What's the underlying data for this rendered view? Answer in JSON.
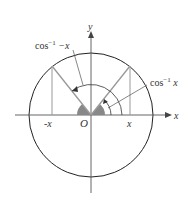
{
  "diagram": {
    "axes": {
      "x_label": "x",
      "y_label": "y",
      "origin_label": "O"
    },
    "tick_labels": {
      "neg_x": "-x",
      "pos_x": "x"
    },
    "annotations": {
      "left_angle": {
        "base": "cos",
        "sup": "−1",
        "arg": " −x"
      },
      "right_angle": {
        "base": "cos",
        "sup": "−1",
        "arg": " x"
      }
    },
    "colors": {
      "circle": "#222222",
      "axis": "#555555",
      "ray": "#999999",
      "shade": "#888888"
    }
  }
}
